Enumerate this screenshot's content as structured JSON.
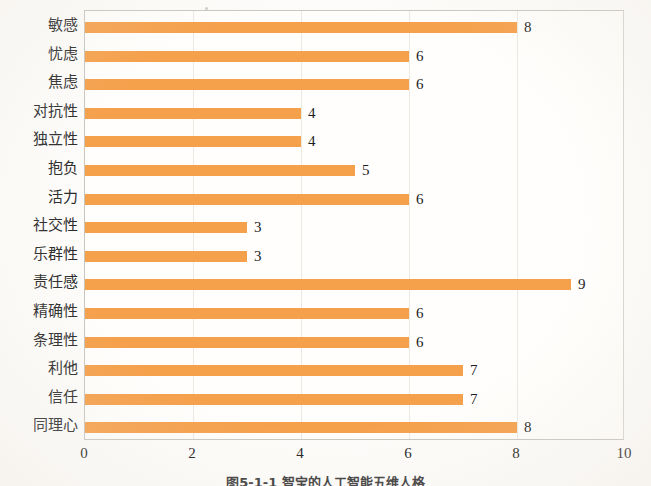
{
  "chart_data": {
    "type": "bar",
    "orientation": "horizontal",
    "title": "",
    "xlabel": "",
    "ylabel": "",
    "xlim": [
      0,
      10
    ],
    "xticks": [
      "0",
      "2",
      "4",
      "6",
      "8",
      "10"
    ],
    "grid": true,
    "legend": "none",
    "bar_color": "#F5A04B",
    "categories": [
      "敏感",
      "忧虑",
      "焦虑",
      "对抗性",
      "独立性",
      "抱负",
      "活力",
      "社交性",
      "乐群性",
      "责任感",
      "精确性",
      "条理性",
      "利他",
      "信任",
      "同理心"
    ],
    "values": [
      8,
      6,
      6,
      4,
      4,
      5,
      6,
      3,
      3,
      9,
      6,
      6,
      7,
      7,
      8
    ],
    "value_labels": [
      "8",
      "6",
      "6",
      "4",
      "4",
      "5",
      "6",
      "3",
      "3",
      "9",
      "6",
      "6",
      "7",
      "7",
      "8"
    ]
  },
  "caption": {
    "text": "图5-1-1  智宝的人工智能五维人格",
    "note_visible": "clipped at image bottom edge"
  }
}
